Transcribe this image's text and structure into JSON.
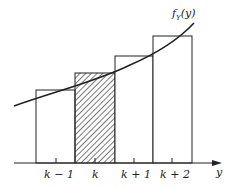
{
  "diagram": {
    "curve_label": "f_Y(y)",
    "curve_label_main": "f",
    "curve_label_sub": "Y",
    "curve_label_arg": "(y)",
    "axis_label": "y",
    "tick_labels": [
      "k − 1",
      "k",
      "k + 1",
      "k + 2"
    ],
    "bars": [
      {
        "label": "k − 1",
        "hatched": false
      },
      {
        "label": "k",
        "hatched": true
      },
      {
        "label": "k + 1",
        "hatched": false
      },
      {
        "label": "k + 2",
        "hatched": false
      }
    ],
    "colors": {
      "line": "#222222",
      "background": "#ffffff"
    }
  }
}
